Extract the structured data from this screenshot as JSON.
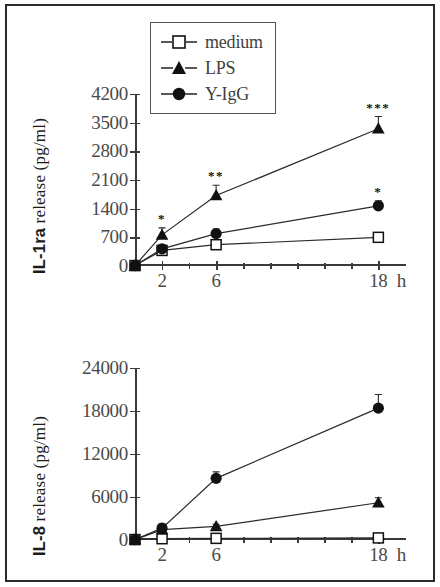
{
  "figure": {
    "legend": {
      "entries": [
        {
          "label": "medium",
          "marker": "open-square",
          "color": "#111111"
        },
        {
          "label": "LPS",
          "marker": "filled-triangle",
          "color": "#111111"
        },
        {
          "label": "Y-IgG",
          "marker": "filled-circle",
          "color": "#111111"
        }
      ]
    }
  },
  "chart_data": [
    {
      "type": "line",
      "id": "il1ra",
      "title": "",
      "xlabel": "",
      "ylabel": "IL-1ra release (pg/ml)",
      "ylabel_bold_prefix": "IL-1ra",
      "ylabel_rest": " release (pg/ml)",
      "x": [
        0,
        2,
        6,
        18
      ],
      "x_unit": "h",
      "xticks": [
        0,
        2,
        6,
        18
      ],
      "xtick_labels": [
        "0",
        "2",
        "6",
        "18"
      ],
      "x_unit_label": "h",
      "xlim": [
        0,
        19.6
      ],
      "x_minor_ticks": [
        4,
        8,
        10,
        12,
        14,
        16
      ],
      "yticks": [
        0,
        700,
        1400,
        2100,
        2800,
        3500,
        4200
      ],
      "ytick_labels": [
        "0",
        "700",
        "1400",
        "2100",
        "2800",
        "3500",
        "4200"
      ],
      "ylim": [
        0,
        4200
      ],
      "grid": false,
      "legend_position": "upper-left",
      "series": [
        {
          "name": "medium",
          "marker": "open-square",
          "values": [
            10,
            380,
            520,
            700
          ],
          "errors": [
            0,
            60,
            70,
            90
          ]
        },
        {
          "name": "LPS",
          "marker": "filled-triangle",
          "values": [
            10,
            760,
            1720,
            3350
          ],
          "errors": [
            0,
            170,
            250,
            300
          ],
          "significance": [
            "",
            "*",
            "**",
            "***"
          ]
        },
        {
          "name": "Y-IgG",
          "marker": "filled-circle",
          "values": [
            10,
            420,
            790,
            1470
          ],
          "errors": [
            0,
            70,
            110,
            120
          ],
          "significance": [
            "",
            "",
            "",
            "*"
          ]
        }
      ]
    },
    {
      "type": "line",
      "id": "il8",
      "title": "",
      "xlabel": "",
      "ylabel": "IL-8 release (pg/ml)",
      "ylabel_bold_prefix": "IL-8",
      "ylabel_rest": " release (pg/ml)",
      "x": [
        0,
        2,
        6,
        18
      ],
      "x_unit": "h",
      "xticks": [
        0,
        2,
        6,
        18
      ],
      "xtick_labels": [
        "0",
        "2",
        "6",
        "18"
      ],
      "x_unit_label": "h",
      "xlim": [
        0,
        19.6
      ],
      "x_minor_ticks": [
        4,
        8,
        10,
        12,
        14,
        16
      ],
      "yticks": [
        0,
        6000,
        12000,
        18000,
        24000
      ],
      "ytick_labels": [
        "0",
        "6000",
        "12000",
        "18000",
        "24000"
      ],
      "ylim": [
        0,
        24000
      ],
      "grid": false,
      "legend_position": "none",
      "series": [
        {
          "name": "medium",
          "marker": "open-square",
          "values": [
            60,
            180,
            230,
            290
          ],
          "errors": [
            0,
            40,
            40,
            50
          ]
        },
        {
          "name": "LPS",
          "marker": "filled-triangle",
          "values": [
            60,
            1450,
            1900,
            5200
          ],
          "errors": [
            0,
            250,
            300,
            700
          ]
        },
        {
          "name": "Y-IgG",
          "marker": "filled-circle",
          "values": [
            60,
            1650,
            8600,
            18400
          ],
          "errors": [
            0,
            600,
            900,
            1900
          ]
        }
      ]
    }
  ]
}
